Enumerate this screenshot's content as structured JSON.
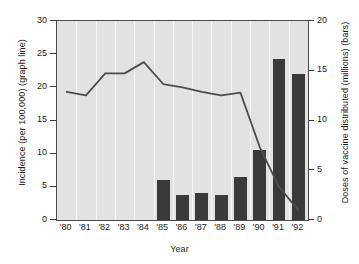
{
  "chart_data": {
    "type": "bar",
    "title": "",
    "subtitle": "",
    "xlabel": "Year",
    "ylabel": "Incidence (per 100,000) (graph line)",
    "ylabel_right": "Doses of vaccine distributed (millions) (bars)",
    "categories": [
      "'80",
      "'81",
      "'82",
      "'83",
      "'84",
      "'85",
      "'86",
      "'87",
      "'88",
      "'89",
      "'90",
      "'91",
      "'92"
    ],
    "ylim": [
      0,
      30
    ],
    "ylim_right": [
      0,
      20
    ],
    "yticks": [
      0,
      5,
      10,
      15,
      20,
      25,
      30
    ],
    "yticks_right": [
      0,
      5,
      10,
      15,
      20
    ],
    "grid": "vertical-white",
    "legend": "none",
    "series": [
      {
        "name": "Doses of vaccine distributed (millions)",
        "type": "bar",
        "axis": "right",
        "color": "#3a3a3a",
        "values": [
          null,
          null,
          null,
          null,
          null,
          4.0,
          2.5,
          2.7,
          2.5,
          4.3,
          7.0,
          16.2,
          14.7
        ]
      },
      {
        "name": "Incidence (per 100,000)",
        "type": "line",
        "axis": "left",
        "color": "#4d4d4d",
        "values": [
          19.3,
          18.8,
          22.1,
          22.1,
          23.8,
          20.5,
          20.0,
          19.3,
          18.8,
          19.2,
          11.0,
          5.0,
          1.5
        ]
      }
    ]
  },
  "axis": {
    "left_title": "Incidence (per 100,000) (graph line)",
    "right_title": "Doses of vaccine distributed (millions) (bars)",
    "x_title": "Year",
    "left_ticks": [
      "30",
      "25",
      "20",
      "15",
      "10",
      "5",
      "0"
    ],
    "right_ticks": [
      "20",
      "15",
      "10",
      "5",
      "0"
    ],
    "x_ticks": [
      "'80",
      "'81",
      "'82",
      "'83",
      "'84",
      "'85",
      "'86",
      "'87",
      "'88",
      "'89",
      "'90",
      "'91",
      "'92"
    ]
  },
  "colors": {
    "bar": "#3a3a3a",
    "line": "#4d4d4d",
    "plot_background": "#e2e2e2",
    "gridline": "#f7f7f7",
    "frame": "#4a4a4a",
    "page_background": "#ffffff",
    "text": "#1a1a1a"
  }
}
